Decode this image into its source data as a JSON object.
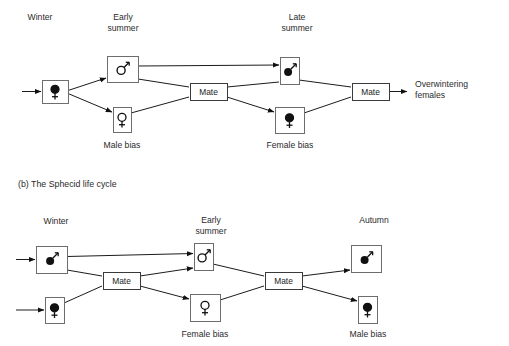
{
  "figure": {
    "caption_b": "(b) The Sphecid life cycle"
  },
  "diagram_a": {
    "season_labels": [
      {
        "text": "Winter",
        "x": 40,
        "y": 20
      },
      {
        "text": "Early",
        "x": 123,
        "y": 20
      },
      {
        "text": "summer",
        "x": 123,
        "y": 31
      },
      {
        "text": "Late",
        "x": 297,
        "y": 20
      },
      {
        "text": "summer",
        "x": 297,
        "y": 31
      }
    ],
    "nodes": [
      {
        "name": "winter-female",
        "symbol": "female",
        "filled": true,
        "x": 42,
        "y": 80,
        "w": 26,
        "h": 23
      },
      {
        "name": "early-summer-male",
        "symbol": "male",
        "filled": false,
        "x": 107,
        "y": 56,
        "w": 31,
        "h": 26
      },
      {
        "name": "male-bias-female",
        "symbol": "female",
        "filled": false,
        "x": 113,
        "y": 107,
        "w": 18,
        "h": 25
      },
      {
        "name": "late-summer-male",
        "symbol": "male",
        "filled": true,
        "x": 280,
        "y": 57,
        "w": 19,
        "h": 27
      },
      {
        "name": "female-bias-female",
        "symbol": "female",
        "filled": true,
        "x": 275,
        "y": 107,
        "w": 29,
        "h": 26
      }
    ],
    "mate_boxes": [
      {
        "label": "Mate",
        "x": 190,
        "y": 83,
        "w": 37,
        "h": 17
      },
      {
        "label": "Mate",
        "x": 352,
        "y": 83,
        "w": 37,
        "h": 17
      }
    ],
    "bias_labels": [
      {
        "text": "Male bias",
        "x": 122,
        "y": 148
      },
      {
        "text": "Female bias",
        "x": 290,
        "y": 148
      }
    ],
    "output_label": {
      "line1": "Overwintering",
      "line2": "females",
      "x": 415,
      "y": 87
    }
  },
  "diagram_b": {
    "season_labels": [
      {
        "text": "Winter",
        "x": 56,
        "y": 224
      },
      {
        "text": "Early",
        "x": 211,
        "y": 223
      },
      {
        "text": "summer",
        "x": 211,
        "y": 234
      },
      {
        "text": "Autumn",
        "x": 374,
        "y": 223
      }
    ],
    "nodes": [
      {
        "name": "winter-male",
        "symbol": "male",
        "filled": true,
        "x": 36,
        "y": 246,
        "w": 31,
        "h": 27
      },
      {
        "name": "winter-female",
        "symbol": "female",
        "filled": true,
        "x": 45,
        "y": 297,
        "w": 19,
        "h": 26
      },
      {
        "name": "early-summer-male",
        "symbol": "male",
        "filled": false,
        "x": 194,
        "y": 243,
        "w": 19,
        "h": 27
      },
      {
        "name": "female-bias-female",
        "symbol": "female",
        "filled": false,
        "x": 190,
        "y": 294,
        "w": 30,
        "h": 27
      },
      {
        "name": "autumn-male",
        "symbol": "male",
        "filled": true,
        "x": 351,
        "y": 245,
        "w": 30,
        "h": 27
      },
      {
        "name": "male-bias-female",
        "symbol": "female",
        "filled": true,
        "x": 358,
        "y": 296,
        "w": 19,
        "h": 27
      }
    ],
    "mate_boxes": [
      {
        "label": "Mate",
        "x": 103,
        "y": 272,
        "w": 37,
        "h": 17
      },
      {
        "label": "Mate",
        "x": 265,
        "y": 272,
        "w": 37,
        "h": 17
      }
    ],
    "bias_labels": [
      {
        "text": "Female bias",
        "x": 205,
        "y": 337
      },
      {
        "text": "Male bias",
        "x": 368,
        "y": 337
      }
    ]
  },
  "colors": {
    "ink": "#1c1c1c",
    "box_stroke": "#6d6d6d",
    "text": "#2b2b2b",
    "background": "#ffffff"
  }
}
